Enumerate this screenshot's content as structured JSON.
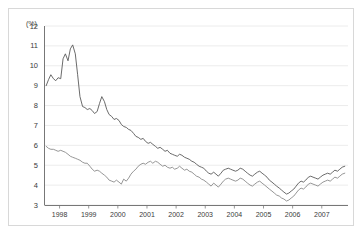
{
  "chart_data": {
    "type": "line",
    "title": "",
    "subtitle": "",
    "xlabel": "",
    "ylabel": "(%)",
    "unit_label": "(%)",
    "grid": true,
    "legend_position": "none",
    "xlim": [
      1997.5,
      2007.9
    ],
    "ylim": [
      3,
      12
    ],
    "yticks": [
      3,
      4,
      5,
      6,
      7,
      8,
      9,
      10,
      11,
      12
    ],
    "ytick_labels": [
      "3",
      "4",
      "5",
      "6",
      "7",
      "8",
      "9",
      "10",
      "11",
      "12"
    ],
    "xticks": [
      1998,
      1999,
      2000,
      2001,
      2002,
      2003,
      2004,
      2005,
      2006,
      2007
    ],
    "xtick_labels": [
      "1998",
      "1999",
      "2000",
      "2001",
      "2002",
      "2003",
      "2004",
      "2005",
      "2006",
      "2007"
    ],
    "series": [
      {
        "name": "upper-rate",
        "color": "#5a5a5a",
        "x": [
          1997.54,
          1997.62,
          1997.7,
          1997.79,
          1997.87,
          1997.95,
          1998.04,
          1998.12,
          1998.2,
          1998.29,
          1998.37,
          1998.45,
          1998.54,
          1998.62,
          1998.7,
          1998.79,
          1998.87,
          1998.95,
          1999.04,
          1999.12,
          1999.2,
          1999.29,
          1999.37,
          1999.45,
          1999.54,
          1999.62,
          1999.7,
          1999.79,
          1999.87,
          1999.95,
          2000.04,
          2000.12,
          2000.2,
          2000.29,
          2000.37,
          2000.45,
          2000.54,
          2000.62,
          2000.7,
          2000.79,
          2000.87,
          2000.95,
          2001.04,
          2001.12,
          2001.2,
          2001.29,
          2001.37,
          2001.45,
          2001.54,
          2001.62,
          2001.7,
          2001.79,
          2001.87,
          2001.95,
          2002.04,
          2002.12,
          2002.2,
          2002.29,
          2002.37,
          2002.45,
          2002.54,
          2002.62,
          2002.7,
          2002.79,
          2002.87,
          2002.95,
          2003.04,
          2003.12,
          2003.2,
          2003.29,
          2003.37,
          2003.45,
          2003.54,
          2003.62,
          2003.7,
          2003.79,
          2003.87,
          2003.95,
          2004.04,
          2004.12,
          2004.2,
          2004.29,
          2004.37,
          2004.45,
          2004.54,
          2004.62,
          2004.7,
          2004.79,
          2004.87,
          2004.95,
          2005.04,
          2005.12,
          2005.2,
          2005.29,
          2005.37,
          2005.45,
          2005.54,
          2005.62,
          2005.7,
          2005.79,
          2005.87,
          2005.95,
          2006.04,
          2006.12,
          2006.2,
          2006.29,
          2006.37,
          2006.45,
          2006.54,
          2006.62,
          2006.7,
          2006.79,
          2006.87,
          2006.95,
          2007.04,
          2007.12,
          2007.2,
          2007.29,
          2007.37,
          2007.45,
          2007.54,
          2007.62,
          2007.7,
          2007.79
        ],
        "y": [
          9.0,
          9.3,
          9.55,
          9.35,
          9.25,
          9.4,
          9.35,
          10.35,
          10.6,
          10.25,
          10.85,
          11.05,
          10.6,
          9.55,
          8.45,
          7.95,
          7.9,
          7.8,
          7.85,
          7.75,
          7.6,
          7.7,
          8.1,
          8.45,
          8.2,
          7.8,
          7.55,
          7.45,
          7.3,
          7.35,
          7.25,
          7.05,
          6.95,
          6.9,
          6.8,
          6.75,
          6.6,
          6.45,
          6.4,
          6.3,
          6.35,
          6.2,
          6.1,
          6.15,
          6.05,
          5.95,
          5.85,
          5.9,
          5.8,
          5.7,
          5.75,
          5.6,
          5.55,
          5.5,
          5.45,
          5.55,
          5.5,
          5.4,
          5.35,
          5.3,
          5.2,
          5.15,
          5.05,
          4.95,
          4.9,
          4.85,
          4.7,
          4.6,
          4.55,
          4.65,
          4.55,
          4.45,
          4.6,
          4.75,
          4.8,
          4.85,
          4.8,
          4.75,
          4.7,
          4.75,
          4.85,
          4.8,
          4.7,
          4.6,
          4.5,
          4.45,
          4.55,
          4.65,
          4.7,
          4.6,
          4.5,
          4.4,
          4.25,
          4.15,
          4.05,
          3.95,
          3.85,
          3.75,
          3.65,
          3.55,
          3.6,
          3.7,
          3.8,
          3.95,
          4.1,
          4.2,
          4.15,
          4.25,
          4.4,
          4.45,
          4.4,
          4.35,
          4.3,
          4.4,
          4.5,
          4.55,
          4.6,
          4.55,
          4.65,
          4.75,
          4.7,
          4.8,
          4.9,
          4.95
        ]
      },
      {
        "name": "lower-rate",
        "color": "#8a8a8a",
        "x": [
          1997.54,
          1997.62,
          1997.7,
          1997.79,
          1997.87,
          1997.95,
          1998.04,
          1998.12,
          1998.2,
          1998.29,
          1998.37,
          1998.45,
          1998.54,
          1998.62,
          1998.7,
          1998.79,
          1998.87,
          1998.95,
          1999.04,
          1999.12,
          1999.2,
          1999.29,
          1999.37,
          1999.45,
          1999.54,
          1999.62,
          1999.7,
          1999.79,
          1999.87,
          1999.95,
          2000.04,
          2000.12,
          2000.2,
          2000.29,
          2000.37,
          2000.45,
          2000.54,
          2000.62,
          2000.7,
          2000.79,
          2000.87,
          2000.95,
          2001.04,
          2001.12,
          2001.2,
          2001.29,
          2001.37,
          2001.45,
          2001.54,
          2001.62,
          2001.7,
          2001.79,
          2001.87,
          2001.95,
          2002.04,
          2002.12,
          2002.2,
          2002.29,
          2002.37,
          2002.45,
          2002.54,
          2002.62,
          2002.7,
          2002.79,
          2002.87,
          2002.95,
          2003.04,
          2003.12,
          2003.2,
          2003.29,
          2003.37,
          2003.45,
          2003.54,
          2003.62,
          2003.7,
          2003.79,
          2003.87,
          2003.95,
          2004.04,
          2004.12,
          2004.2,
          2004.29,
          2004.37,
          2004.45,
          2004.54,
          2004.62,
          2004.7,
          2004.79,
          2004.87,
          2004.95,
          2005.04,
          2005.12,
          2005.2,
          2005.29,
          2005.37,
          2005.45,
          2005.54,
          2005.62,
          2005.7,
          2005.79,
          2005.87,
          2005.95,
          2006.04,
          2006.12,
          2006.2,
          2006.29,
          2006.37,
          2006.45,
          2006.54,
          2006.62,
          2006.7,
          2006.79,
          2006.87,
          2006.95,
          2007.04,
          2007.12,
          2007.2,
          2007.29,
          2007.37,
          2007.45,
          2007.54,
          2007.62,
          2007.7,
          2007.79
        ],
        "y": [
          5.95,
          5.85,
          5.8,
          5.8,
          5.75,
          5.7,
          5.75,
          5.7,
          5.65,
          5.55,
          5.45,
          5.4,
          5.35,
          5.3,
          5.25,
          5.15,
          5.1,
          5.1,
          4.95,
          4.8,
          4.7,
          4.75,
          4.7,
          4.6,
          4.5,
          4.4,
          4.25,
          4.2,
          4.15,
          4.25,
          4.15,
          4.05,
          4.3,
          4.2,
          4.35,
          4.55,
          4.7,
          4.8,
          4.95,
          5.05,
          5.1,
          5.05,
          5.15,
          5.2,
          5.1,
          5.2,
          5.15,
          5.05,
          4.95,
          5.0,
          4.9,
          4.85,
          4.9,
          4.8,
          4.85,
          4.95,
          4.85,
          4.75,
          4.8,
          4.7,
          4.65,
          4.55,
          4.45,
          4.4,
          4.3,
          4.25,
          4.15,
          4.05,
          3.95,
          4.1,
          4.0,
          3.9,
          4.05,
          4.2,
          4.3,
          4.35,
          4.3,
          4.25,
          4.2,
          4.25,
          4.35,
          4.3,
          4.2,
          4.1,
          4.0,
          3.95,
          4.05,
          4.15,
          4.2,
          4.1,
          4.0,
          3.9,
          3.8,
          3.7,
          3.6,
          3.5,
          3.45,
          3.35,
          3.3,
          3.2,
          3.25,
          3.35,
          3.45,
          3.6,
          3.75,
          3.85,
          3.8,
          3.9,
          4.05,
          4.1,
          4.05,
          4.0,
          3.95,
          4.05,
          4.15,
          4.2,
          4.25,
          4.2,
          4.3,
          4.4,
          4.35,
          4.45,
          4.55,
          4.6
        ]
      }
    ]
  },
  "axes": {
    "unit_text": "(%)"
  }
}
